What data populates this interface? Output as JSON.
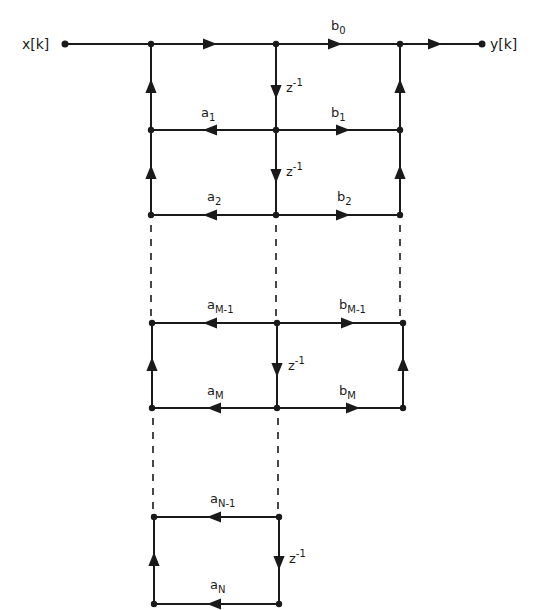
{
  "diagram": {
    "type": "signal-flow-graph",
    "input_label": "x[k]",
    "output_label": "y[k]",
    "delay_label": "z",
    "delay_exp": "-1",
    "colors": {
      "stroke": "#1a1a1a",
      "background": "#ffffff"
    },
    "labels": {
      "b0": {
        "base": "b",
        "sub": "0"
      },
      "a1": {
        "base": "a",
        "sub": "1"
      },
      "b1": {
        "base": "b",
        "sub": "1"
      },
      "a2": {
        "base": "a",
        "sub": "2"
      },
      "b2": {
        "base": "b",
        "sub": "2"
      },
      "aM1": {
        "base": "a",
        "sub": "M-1"
      },
      "bM1": {
        "base": "b",
        "sub": "M-1"
      },
      "aM": {
        "base": "a",
        "sub": "M"
      },
      "bM": {
        "base": "b",
        "sub": "M"
      },
      "aN1": {
        "base": "a",
        "sub": "N-1"
      },
      "aN": {
        "base": "a",
        "sub": "N"
      }
    }
  }
}
